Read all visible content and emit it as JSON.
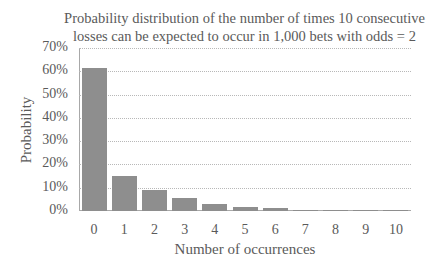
{
  "chart_data": {
    "type": "bar",
    "title": "Probability distribution of the number of times 10 consecutive losses can be expected to occur in 1,000 bets with odds = 2",
    "title_lines": [
      "Probability distribution of the number of times 10 consecutive",
      "losses can be expected to occur in 1,000 bets with odds = 2"
    ],
    "xlabel": "Number of occurrences",
    "ylabel": "Probability",
    "categories": [
      "0",
      "1",
      "2",
      "3",
      "4",
      "5",
      "6",
      "7",
      "8",
      "9",
      "10"
    ],
    "values": [
      61.4,
      14.9,
      9.1,
      5.6,
      3.0,
      1.9,
      1.1,
      0.6,
      0.3,
      0.1,
      0.05
    ],
    "value_unit": "%",
    "ylim": [
      0,
      70
    ],
    "yticks": [
      "0%",
      "10%",
      "20%",
      "30%",
      "40%",
      "50%",
      "60%",
      "70%"
    ],
    "grid": true,
    "grid_style": "dotted horizontal",
    "legend": null,
    "bar_color": "#8e8e8e"
  }
}
